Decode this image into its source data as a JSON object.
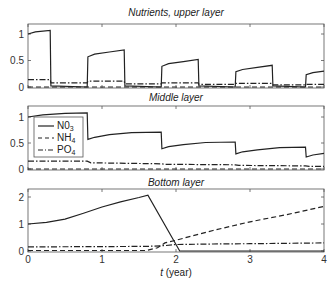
{
  "chart_data": [
    {
      "type": "line",
      "title": "Nutrients, upper layer",
      "xlabel": "",
      "ylabel": "",
      "xlim": [
        0,
        4
      ],
      "ylim": [
        0,
        1.2
      ],
      "yticks": [
        0,
        0.5,
        1
      ],
      "ytick_labels": [
        "0",
        "0.5",
        "1"
      ],
      "grid": false,
      "series": [
        {
          "name": "NO3",
          "style": "solid",
          "points": [
            [
              0,
              1.0
            ],
            [
              0.1,
              1.04
            ],
            [
              0.3,
              1.07
            ],
            [
              0.31,
              0.02
            ],
            [
              0.8,
              0.0
            ],
            [
              0.81,
              0.57
            ],
            [
              0.9,
              0.62
            ],
            [
              1.1,
              0.66
            ],
            [
              1.3,
              0.7
            ],
            [
              1.31,
              0.02
            ],
            [
              1.8,
              0.0
            ],
            [
              1.81,
              0.39
            ],
            [
              1.9,
              0.44
            ],
            [
              2.1,
              0.48
            ],
            [
              2.3,
              0.52
            ],
            [
              2.31,
              0.02
            ],
            [
              2.8,
              0.0
            ],
            [
              2.81,
              0.29
            ],
            [
              2.9,
              0.33
            ],
            [
              3.1,
              0.37
            ],
            [
              3.3,
              0.41
            ],
            [
              3.31,
              0.02
            ],
            [
              3.75,
              0.0
            ],
            [
              3.76,
              0.23
            ],
            [
              3.85,
              0.27
            ],
            [
              4.0,
              0.3
            ]
          ]
        },
        {
          "name": "NH4",
          "style": "dashed",
          "points": [
            [
              0,
              0.0
            ],
            [
              4,
              0.0
            ]
          ]
        },
        {
          "name": "PO4",
          "style": "dashdot",
          "points": [
            [
              0,
              0.14
            ],
            [
              0.3,
              0.14
            ],
            [
              0.31,
              0.08
            ],
            [
              0.8,
              0.08
            ],
            [
              0.81,
              0.11
            ],
            [
              1.3,
              0.11
            ],
            [
              1.31,
              0.06
            ],
            [
              1.8,
              0.06
            ],
            [
              1.81,
              0.08
            ],
            [
              2.3,
              0.08
            ],
            [
              2.31,
              0.05
            ],
            [
              2.8,
              0.05
            ],
            [
              2.81,
              0.07
            ],
            [
              3.3,
              0.07
            ],
            [
              3.31,
              0.04
            ],
            [
              3.75,
              0.04
            ],
            [
              3.76,
              0.05
            ],
            [
              4,
              0.05
            ]
          ]
        }
      ]
    },
    {
      "type": "line",
      "title": "Middle layer",
      "xlabel": "",
      "ylabel": "",
      "xlim": [
        0,
        4
      ],
      "ylim": [
        0,
        1.2
      ],
      "yticks": [
        0,
        0.5,
        1
      ],
      "ytick_labels": [
        "0",
        "0.5",
        "1"
      ],
      "grid": false,
      "legend": {
        "position": "left",
        "entries": [
          "N0₃",
          "NH₄",
          "PO₄"
        ]
      },
      "series": [
        {
          "name": "NO3",
          "style": "solid",
          "points": [
            [
              0,
              1.0
            ],
            [
              0.2,
              1.04
            ],
            [
              0.5,
              1.07
            ],
            [
              0.8,
              1.08
            ],
            [
              0.81,
              0.57
            ],
            [
              0.9,
              0.61
            ],
            [
              1.1,
              0.66
            ],
            [
              1.4,
              0.7
            ],
            [
              1.8,
              0.71
            ],
            [
              1.81,
              0.39
            ],
            [
              1.9,
              0.43
            ],
            [
              2.1,
              0.47
            ],
            [
              2.4,
              0.51
            ],
            [
              2.8,
              0.52
            ],
            [
              2.81,
              0.29
            ],
            [
              2.9,
              0.33
            ],
            [
              3.1,
              0.37
            ],
            [
              3.4,
              0.41
            ],
            [
              3.75,
              0.42
            ],
            [
              3.76,
              0.23
            ],
            [
              3.85,
              0.27
            ],
            [
              4.0,
              0.3
            ]
          ]
        },
        {
          "name": "NH4",
          "style": "dashed",
          "points": [
            [
              0,
              0.0
            ],
            [
              4,
              0.0
            ]
          ]
        },
        {
          "name": "PO4",
          "style": "dashdot",
          "points": [
            [
              0,
              0.15
            ],
            [
              0.8,
              0.15
            ],
            [
              0.85,
              0.12
            ],
            [
              1.8,
              0.1
            ],
            [
              1.85,
              0.09
            ],
            [
              2.8,
              0.08
            ],
            [
              2.85,
              0.07
            ],
            [
              3.75,
              0.06
            ],
            [
              3.8,
              0.05
            ],
            [
              4,
              0.05
            ]
          ]
        }
      ]
    },
    {
      "type": "line",
      "title": "Bottom layer",
      "xlabel": "t (year)",
      "ylabel": "",
      "xlim": [
        0,
        4
      ],
      "ylim": [
        0,
        2.3
      ],
      "xticks": [
        0,
        1,
        2,
        3,
        4
      ],
      "xtick_labels": [
        "0",
        "1",
        "2",
        "3",
        "4"
      ],
      "yticks": [
        0,
        1,
        2
      ],
      "ytick_labels": [
        "0",
        "1",
        "2"
      ],
      "grid": false,
      "series": [
        {
          "name": "NO3",
          "style": "solid",
          "points": [
            [
              0,
              1.0
            ],
            [
              0.25,
              1.06
            ],
            [
              0.5,
              1.18
            ],
            [
              0.75,
              1.4
            ],
            [
              1.0,
              1.63
            ],
            [
              1.25,
              1.82
            ],
            [
              1.5,
              1.98
            ],
            [
              1.62,
              2.07
            ],
            [
              2.05,
              0.0
            ],
            [
              4,
              0.0
            ]
          ]
        },
        {
          "name": "NH4",
          "style": "dashed",
          "points": [
            [
              0,
              0.02
            ],
            [
              1.6,
              0.02
            ],
            [
              1.75,
              0.12
            ],
            [
              1.85,
              0.3
            ],
            [
              2.0,
              0.4
            ],
            [
              2.5,
              0.76
            ],
            [
              3.0,
              1.08
            ],
            [
              3.5,
              1.35
            ],
            [
              4.0,
              1.65
            ]
          ]
        },
        {
          "name": "PO4",
          "style": "dashdot",
          "points": [
            [
              0,
              0.15
            ],
            [
              1.6,
              0.17
            ],
            [
              1.85,
              0.2
            ],
            [
              2.0,
              0.24
            ],
            [
              2.5,
              0.26
            ],
            [
              3.0,
              0.27
            ],
            [
              4.0,
              0.3
            ]
          ]
        }
      ]
    }
  ],
  "labels": {
    "upper_title": "Nutrients, upper layer",
    "middle_title": "Middle layer",
    "bottom_title": "Bottom layer",
    "xlabel_t": "t",
    "xlabel_unit": " (year)",
    "legend_no3": "N0",
    "legend_no3_sub": "3",
    "legend_nh4": "NH",
    "legend_nh4_sub": "4",
    "legend_po4": "PO",
    "legend_po4_sub": "4"
  }
}
